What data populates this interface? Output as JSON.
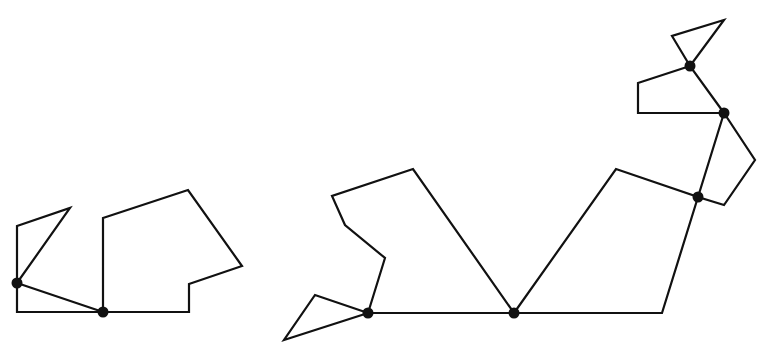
{
  "diagram": {
    "colors": {
      "background": "#ffffff",
      "stroke": "#111111",
      "joint": "#111111"
    },
    "figures": [
      {
        "id": "left-figure",
        "joints": [
          {
            "id": "A",
            "x": 17,
            "y": 283
          },
          {
            "id": "B",
            "x": 103,
            "y": 312
          }
        ],
        "polygons": [
          {
            "id": "left-triangle",
            "points": [
              [
                17,
                283
              ],
              [
                17,
                226
              ],
              [
                70,
                208
              ]
            ]
          },
          {
            "id": "left-lower-triangle",
            "points": [
              [
                17,
                283
              ],
              [
                17,
                312
              ],
              [
                103,
                312
              ]
            ]
          },
          {
            "id": "left-hexagon",
            "points": [
              [
                103,
                312
              ],
              [
                103,
                218
              ],
              [
                188,
                190
              ],
              [
                242,
                266
              ],
              [
                189,
                284
              ],
              [
                189,
                312
              ]
            ]
          }
        ]
      },
      {
        "id": "right-figure",
        "joints": [
          {
            "id": "C",
            "x": 368,
            "y": 313
          },
          {
            "id": "D",
            "x": 514,
            "y": 313
          },
          {
            "id": "E",
            "x": 698,
            "y": 197
          },
          {
            "id": "F",
            "x": 724,
            "y": 113
          },
          {
            "id": "G",
            "x": 690,
            "y": 66
          }
        ],
        "polygons": [
          {
            "id": "tail-triangle",
            "points": [
              [
                368,
                313
              ],
              [
                315,
                295
              ],
              [
                284,
                340
              ]
            ]
          },
          {
            "id": "body-hexagon",
            "points": [
              [
                368,
                313
              ],
              [
                385,
                258
              ],
              [
                345,
                225
              ],
              [
                332,
                196
              ],
              [
                413,
                169
              ],
              [
                514,
                313
              ]
            ]
          },
          {
            "id": "body-quadrilateral",
            "points": [
              [
                514,
                313
              ],
              [
                616,
                169
              ],
              [
                698,
                197
              ],
              [
                662,
                313
              ]
            ]
          },
          {
            "id": "neck-quadrilateral",
            "points": [
              [
                698,
                197
              ],
              [
                724,
                113
              ],
              [
                755,
                160
              ],
              [
                724,
                205
              ]
            ]
          },
          {
            "id": "head-quadrilateral",
            "points": [
              [
                724,
                113
              ],
              [
                690,
                66
              ],
              [
                638,
                83
              ],
              [
                638,
                113
              ]
            ]
          },
          {
            "id": "top-triangle",
            "points": [
              [
                690,
                66
              ],
              [
                672,
                36
              ],
              [
                724,
                20
              ]
            ]
          }
        ]
      }
    ]
  }
}
